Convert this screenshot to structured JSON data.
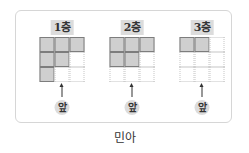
{
  "figure": {
    "floors": [
      {
        "label": "1층",
        "grid": [
          [
            1,
            1,
            1
          ],
          [
            1,
            1,
            0
          ],
          [
            1,
            0,
            0
          ]
        ],
        "front_label": "앞"
      },
      {
        "label": "2층",
        "grid": [
          [
            1,
            1,
            1
          ],
          [
            1,
            1,
            0
          ],
          [
            0,
            0,
            0
          ]
        ],
        "front_label": "앞"
      },
      {
        "label": "3층",
        "grid": [
          [
            1,
            1,
            0
          ],
          [
            0,
            0,
            0
          ],
          [
            0,
            0,
            0
          ]
        ],
        "front_label": "앞"
      }
    ],
    "caption": "민아"
  },
  "colors": {
    "filled_cell": "#cfcfcf",
    "label_bg": "#dcdcdc",
    "frame_border": "#d6d6d6"
  }
}
